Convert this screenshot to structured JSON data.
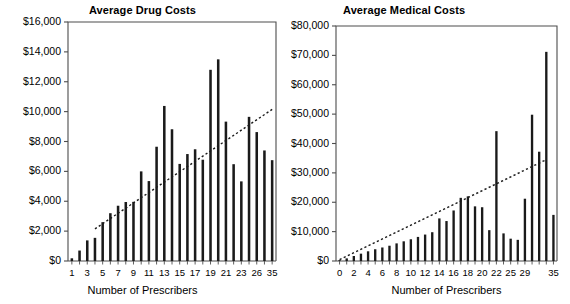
{
  "figure": {
    "width": 570,
    "height": 304,
    "background": "#ffffff",
    "ink_color": "#1a1a1a",
    "axis_color": "#4d4d4d"
  },
  "charts": [
    {
      "panel_id": "left",
      "title": "Average Drug Costs",
      "xlabel": "Number of Prescribers",
      "ylabel": "",
      "ytick_labels": [
        "$0",
        "$2,000",
        "$4,000",
        "$6,000",
        "$8,000",
        "$10,000",
        "$12,000",
        "$14,000",
        "$16,000"
      ],
      "xtick_labels": [
        "1",
        "3",
        "5",
        "7",
        "9",
        "11",
        "13",
        "15",
        "17",
        "19",
        "21",
        "23",
        "26",
        "35"
      ]
    },
    {
      "panel_id": "right",
      "title": "Average Medical Costs",
      "xlabel": "Number of Prescribers",
      "ylabel": "",
      "ytick_labels": [
        "$0",
        "$10,000",
        "$20,000",
        "$30,000",
        "$40,000",
        "$50,000",
        "$60,000",
        "$70,000",
        "$80,000"
      ],
      "xtick_labels": [
        "0",
        "2",
        "4",
        "6",
        "8",
        "10",
        "12",
        "14",
        "16",
        "18",
        "20",
        "22",
        "25",
        "29",
        "35"
      ]
    }
  ],
  "chart_data": [
    {
      "type": "bar",
      "panel": "left",
      "title": "Average Drug Costs",
      "xlabel": "Number of Prescribers",
      "ylabel": "",
      "ylim": [
        0,
        16000
      ],
      "ytick_values": [
        0,
        2000,
        4000,
        6000,
        8000,
        10000,
        12000,
        14000,
        16000
      ],
      "ytick_labels": [
        "$0",
        "$2,000",
        "$4,000",
        "$6,000",
        "$8,000",
        "$10,000",
        "$12,000",
        "$14,000",
        "$16,000"
      ],
      "xtick_labels": [
        "1",
        "3",
        "5",
        "7",
        "9",
        "11",
        "13",
        "15",
        "17",
        "19",
        "21",
        "23",
        "26",
        "35"
      ],
      "grid": false,
      "legend": "none",
      "categories": [
        "1",
        "2",
        "3",
        "4",
        "5",
        "6",
        "7",
        "8",
        "9",
        "10",
        "11",
        "12",
        "13",
        "14",
        "15",
        "16",
        "17",
        "18",
        "19",
        "20",
        "21",
        "22",
        "23",
        "24",
        "25",
        "26",
        "27",
        "28",
        "29",
        "30",
        "31",
        "32",
        "33",
        "34",
        "35"
      ],
      "values": [
        180,
        700,
        1380,
        1550,
        2600,
        3200,
        3700,
        3950,
        3960,
        6000,
        5350,
        7650,
        10380,
        8820,
        6500,
        7160,
        7480,
        6780,
        12800,
        13500,
        9330,
        6480,
        5330,
        9650,
        8630,
        7400,
        6750
      ],
      "trendline": {
        "style": "dotted",
        "x_start_category_index": 3,
        "x_end_category_index": 26,
        "y_start": 2150,
        "y_end": 10150
      }
    },
    {
      "type": "bar",
      "panel": "right",
      "title": "Average Medical Costs",
      "xlabel": "Number of Prescribers",
      "ylabel": "",
      "ylim": [
        0,
        80000
      ],
      "ytick_values": [
        0,
        10000,
        20000,
        30000,
        40000,
        50000,
        60000,
        70000,
        80000
      ],
      "ytick_labels": [
        "$0",
        "$10,000",
        "$20,000",
        "$30,000",
        "$40,000",
        "$50,000",
        "$60,000",
        "$70,000",
        "$80,000"
      ],
      "xtick_labels": [
        "0",
        "2",
        "4",
        "6",
        "8",
        "10",
        "12",
        "14",
        "16",
        "18",
        "20",
        "22",
        "25",
        "29",
        "35"
      ],
      "grid": false,
      "legend": "none",
      "categories": [
        "0",
        "1",
        "2",
        "3",
        "4",
        "5",
        "6",
        "7",
        "8",
        "9",
        "10",
        "11",
        "12",
        "13",
        "14",
        "15",
        "16",
        "17",
        "18",
        "19",
        "20",
        "21",
        "22",
        "23",
        "24",
        "25",
        "26",
        "27",
        "28",
        "29",
        "30"
      ],
      "values": [
        300,
        900,
        1700,
        2500,
        3300,
        4000,
        4600,
        5200,
        6000,
        6700,
        7400,
        8200,
        9000,
        9800,
        14500,
        13600,
        17200,
        21500,
        22000,
        18600,
        18300,
        10500,
        44200,
        9400,
        7600,
        7200,
        21200,
        49800,
        37200,
        71200,
        15700
      ],
      "trendline": {
        "style": "dotted",
        "x_start_category_index": 0,
        "x_end_category_index": 29,
        "y_start": 500,
        "y_end": 34500
      }
    }
  ]
}
